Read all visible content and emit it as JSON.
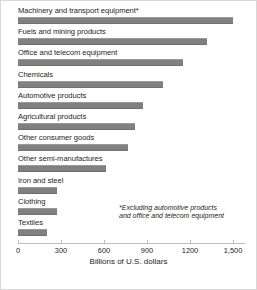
{
  "chart_data": {
    "type": "bar",
    "orientation": "horizontal",
    "title": "",
    "xlabel": "Billions of U.S. dollars",
    "ylabel": "",
    "xlim": [
      0,
      1500
    ],
    "grid": false,
    "legend": null,
    "tick_labels": [
      "0",
      "300",
      "600",
      "900",
      "1200",
      "1,500"
    ],
    "tick_values": [
      0,
      300,
      600,
      900,
      1200,
      1500
    ],
    "categories": [
      "Machinery and transport equipment*",
      "Fuels and mining products",
      "Office and telecom equipment",
      "Chemicals",
      "Automotive products",
      "Agricultural products",
      "Other consumer goods",
      "Other semi-manufactures",
      "Iron and steel",
      "Clothing",
      "Textiles"
    ],
    "values": [
      1500,
      1320,
      1150,
      1010,
      870,
      815,
      770,
      615,
      270,
      270,
      205
    ],
    "annotations": [
      "*Excluding automotive products",
      "and office and telecom equipment"
    ],
    "bar_color": "#808080"
  }
}
